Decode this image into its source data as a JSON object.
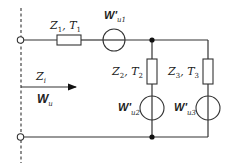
{
  "diagram": {
    "type": "equivalent-circuit",
    "labels": {
      "z1_main": "Z",
      "z1_sub": "1",
      "t1_main": "T",
      "t1_sub": "1",
      "sep": ", ",
      "wu1_main": "W'",
      "wu1_sub": "u1",
      "z2_main": "Z",
      "z2_sub": "2",
      "t2_main": "T",
      "t2_sub": "2",
      "z3_main": "Z",
      "z3_sub": "3",
      "t3_main": "T",
      "t3_sub": "3",
      "wu2_main": "W'",
      "wu2_sub": "u2",
      "wu3_main": "W'",
      "wu3_sub": "u3",
      "zi_main": "Z",
      "zi_sub": "i",
      "wu_main": "W",
      "wu_sub": "u"
    },
    "components": [
      {
        "id": "Z1",
        "kind": "resistor",
        "label": "Z1, T1"
      },
      {
        "id": "Wu1",
        "kind": "source",
        "label": "W'u1"
      },
      {
        "id": "Z2",
        "kind": "resistor",
        "label": "Z2, T2"
      },
      {
        "id": "Wu2",
        "kind": "source",
        "label": "W'u2"
      },
      {
        "id": "Z3",
        "kind": "resistor",
        "label": "Z3, T3"
      },
      {
        "id": "Wu3",
        "kind": "source",
        "label": "W'u3"
      }
    ],
    "colors": {
      "line": "#333333",
      "background": "#ffffff"
    }
  }
}
